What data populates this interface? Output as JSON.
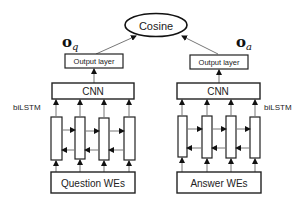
{
  "diagram": {
    "type": "qa-bilstm-cnn-architecture",
    "top": {
      "label": "Cosine",
      "shape": "ellipse"
    },
    "vectors": {
      "question": "o",
      "question_sub": "q",
      "answer": "o",
      "answer_sub": "a"
    },
    "left_branch": {
      "output_layer": "Output layer",
      "cnn": "CNN",
      "rnn_label": "biLSTM",
      "input": "Question WEs",
      "cells": 4
    },
    "right_branch": {
      "output_layer": "Output layer",
      "cnn": "CNN",
      "rnn_label": "biLSTM",
      "input": "Answer WEs",
      "cells": 4
    },
    "colors": {
      "stroke": "#222222",
      "arrow": "#555555",
      "background": "#ffffff"
    }
  }
}
